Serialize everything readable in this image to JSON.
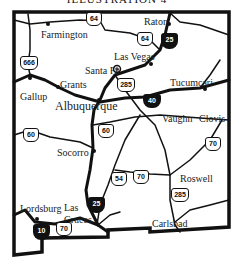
{
  "title": "ILLUSTRATION 4",
  "map": {
    "region": "New Mexico",
    "cities": [
      {
        "name": "Raton",
        "x": 171,
        "y": 21
      },
      {
        "name": "Farmington",
        "x": 42,
        "y": 30
      },
      {
        "name": "Las Vegas",
        "x": 114,
        "y": 53
      },
      {
        "name": "Santa Fe",
        "x": 85,
        "y": 67
      },
      {
        "name": "Grants",
        "x": 60,
        "y": 80
      },
      {
        "name": "Tucumcari",
        "x": 170,
        "y": 81
      },
      {
        "name": "Gallup",
        "x": 20,
        "y": 92
      },
      {
        "name": "Albuquerque",
        "x": 55,
        "y": 101
      },
      {
        "name": "Vaughn",
        "x": 162,
        "y": 117
      },
      {
        "name": "Clovis",
        "x": 200,
        "y": 117
      },
      {
        "name": "Socorro",
        "x": 57,
        "y": 148
      },
      {
        "name": "Roswell",
        "x": 180,
        "y": 174
      },
      {
        "name": "Lordsburg",
        "x": 20,
        "y": 205
      },
      {
        "name": "Las",
        "x": 64,
        "y": 204
      },
      {
        "name": "Cruces",
        "x": 64,
        "y": 216
      },
      {
        "name": "Carlsbad",
        "x": 150,
        "y": 220
      }
    ],
    "routes": {
      "us": [
        {
          "number": "64",
          "x": 86,
          "y": 17
        },
        {
          "number": "64",
          "x": 137,
          "y": 34
        },
        {
          "number": "666",
          "x": 20,
          "y": 57
        },
        {
          "number": "285",
          "x": 118,
          "y": 80
        },
        {
          "number": "60",
          "x": 24,
          "y": 131
        },
        {
          "number": "60",
          "x": 99,
          "y": 127
        },
        {
          "number": "70",
          "x": 206,
          "y": 137
        },
        {
          "number": "54",
          "x": 112,
          "y": 176
        },
        {
          "number": "70",
          "x": 133,
          "y": 173
        },
        {
          "number": "285",
          "x": 172,
          "y": 190
        },
        {
          "number": "70",
          "x": 57,
          "y": 225
        }
      ],
      "interstate": [
        {
          "number": "25",
          "x": 161,
          "y": 34
        },
        {
          "number": "40",
          "x": 144,
          "y": 97
        },
        {
          "number": "25",
          "x": 88,
          "y": 200
        },
        {
          "number": "10",
          "x": 33,
          "y": 226
        }
      ]
    }
  }
}
